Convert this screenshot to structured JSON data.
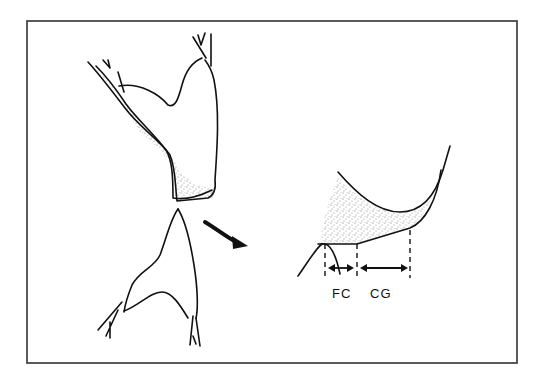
{
  "figure": {
    "labels": {
      "fc": "FC",
      "cg": "CG"
    },
    "colors": {
      "line": "#111111",
      "frame": "#333333",
      "stipple": "#8a8a8a",
      "background": "#ffffff"
    },
    "elements": [
      "upper-tooth-outline",
      "lower-tooth-outline",
      "stippled-contact-region",
      "curved-arrow",
      "magnified-contact-detail",
      "fc-dimension",
      "cg-dimension"
    ]
  }
}
